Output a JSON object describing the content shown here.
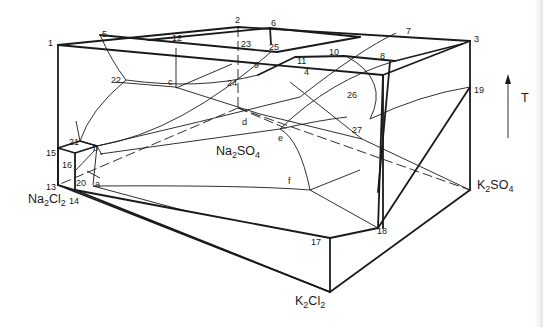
{
  "figure": {
    "type": "ternary reciprocal salt system prism (temperature-composition)",
    "axis": {
      "label": "T",
      "direction": "up"
    },
    "components": {
      "na2cl2": {
        "base": "Na",
        "sub1": "2",
        "mid": "Cl",
        "sub2": "2"
      },
      "na2so4": {
        "base": "Na",
        "sub1": "2",
        "mid": "SO",
        "sub2": "4"
      },
      "k2so4": {
        "base": "K",
        "sub1": "2",
        "mid": "SO",
        "sub2": "4"
      },
      "k2cl2": {
        "base": "K",
        "sub1": "2",
        "mid": "Cl",
        "sub2": "2"
      }
    },
    "point_labels": {
      "p1": "1",
      "p2": "2",
      "p3": "3",
      "p4": "4",
      "p5": "5",
      "p6": "6",
      "p7": "7",
      "p8": "8",
      "p9": "9",
      "p10": "10",
      "p11": "11",
      "p12": "12",
      "p13": "13",
      "p14": "14",
      "p15": "15",
      "p16": "16",
      "p17": "17",
      "p18": "18",
      "p19": "19",
      "p20": "20",
      "p21": "21",
      "p22": "22",
      "p23": "23",
      "p24": "24",
      "p25": "25",
      "p26": "26",
      "p27": "27",
      "pa": "a",
      "pb": "b",
      "pc": "c",
      "pd": "d",
      "pe": "e",
      "pf": "f"
    }
  }
}
